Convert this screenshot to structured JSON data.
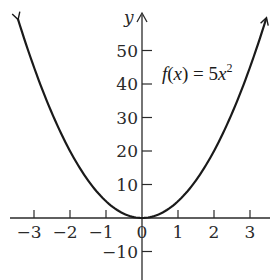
{
  "chart_data": {
    "type": "line",
    "title": "",
    "xlabel": "",
    "ylabel": "y",
    "function": "f(x) = 5x^2",
    "annotation": "f(x) = 5x²",
    "xlim": [
      -3.7,
      3.5
    ],
    "ylim": [
      -18,
      61
    ],
    "grid": false,
    "legend": "none",
    "x_ticks": [
      -3,
      -2,
      -1,
      0,
      1,
      2,
      3
    ],
    "x_tick_labels": [
      "−3",
      "−2",
      "−1",
      "0",
      "1",
      "2",
      "3"
    ],
    "y_ticks": [
      -10,
      10,
      20,
      30,
      40,
      50
    ],
    "y_tick_labels": [
      "−10",
      "10",
      "20",
      "30",
      "40",
      "50"
    ],
    "series": [
      {
        "name": "f(x) = 5x²",
        "x": [
          -3.45,
          -3,
          -2.5,
          -2,
          -1.5,
          -1,
          -0.5,
          0,
          0.5,
          1,
          1.5,
          2,
          2.5,
          3,
          3.45
        ],
        "y": [
          59.5,
          45,
          31.25,
          20,
          11.25,
          5,
          1.25,
          0,
          1.25,
          5,
          11.25,
          20,
          31.25,
          45,
          59.5
        ],
        "color": "#1a1a1a",
        "arrows_at_ends": true
      }
    ]
  },
  "colors": {
    "background": "#ffffff",
    "axis": "#2a2a2a",
    "curve": "#1a1a1a"
  }
}
